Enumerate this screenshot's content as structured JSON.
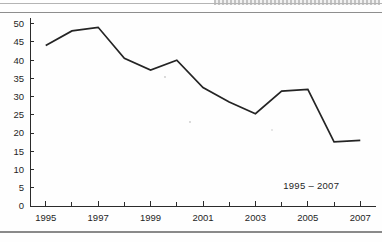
{
  "page": {
    "header_fragment": "",
    "background_color": "#fefefe",
    "rule_color": "#8e8e8e"
  },
  "annotation": {
    "range_label": "1995 – 2007"
  },
  "chart_data": {
    "type": "line",
    "title": "",
    "subtitle": "",
    "xlabel": "",
    "ylabel": "",
    "categories": [
      1995,
      1996,
      1997,
      1998,
      1999,
      2000,
      2001,
      2002,
      2003,
      2004,
      2005,
      2006,
      2007
    ],
    "values": [
      44.0,
      48.0,
      49.0,
      40.5,
      37.3,
      40.0,
      32.5,
      28.5,
      25.3,
      31.5,
      32.0,
      17.6,
      18.0
    ],
    "series": [
      {
        "name": "series-1",
        "color": "#242424",
        "values": [
          44.0,
          48.0,
          49.0,
          40.5,
          37.3,
          40.0,
          32.5,
          28.5,
          25.3,
          31.5,
          32.0,
          17.6,
          18.0
        ]
      }
    ],
    "xlim": [
      1994.4,
      2007.6
    ],
    "ylim": [
      0,
      51
    ],
    "ytick_labels": [
      "50",
      "45",
      "40",
      "35",
      "30",
      "25",
      "20",
      "15",
      "10",
      "5",
      "0"
    ],
    "ytick_values": [
      50,
      45,
      40,
      35,
      30,
      25,
      20,
      15,
      10,
      5,
      0
    ],
    "xtick_labels": [
      "1995",
      "1997",
      "1999",
      "2001",
      "2003",
      "2005",
      "2007"
    ],
    "xtick_values": [
      1995,
      1997,
      1999,
      2001,
      2003,
      2005,
      2007
    ],
    "xminor_values": [
      1996,
      1998,
      2000,
      2002,
      2004,
      2006
    ],
    "grid": false,
    "legend": null,
    "annotations": [
      {
        "text": "1995 – 2007",
        "x": 2006.2,
        "y": 4.6,
        "align": "right"
      }
    ]
  }
}
